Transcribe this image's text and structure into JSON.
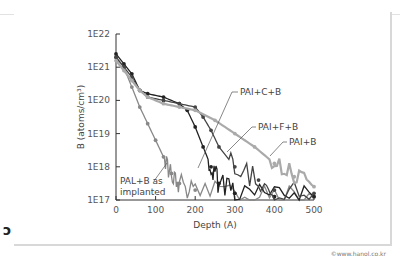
{
  "chart_data": {
    "type": "line",
    "title": "",
    "xlabel": "Depth (A)",
    "ylabel": "B (atoms/cm³)",
    "xlim": [
      0,
      500
    ],
    "ylim_log": [
      "1E17",
      "1E22"
    ],
    "x_ticks": [
      "0",
      "100",
      "200",
      "300",
      "400",
      "500"
    ],
    "y_ticks": [
      "1E17",
      "1E18",
      "1E19",
      "1E20",
      "1E21",
      "1E22"
    ],
    "grid": false,
    "series": [
      {
        "name": "PAI+B as implanted",
        "color": "#888888",
        "x": [
          0,
          20,
          40,
          60,
          80,
          100,
          120,
          140,
          160,
          200,
          300,
          400,
          500
        ],
        "log10_y": [
          21.3,
          21.0,
          20.4,
          19.8,
          19.3,
          18.8,
          18.3,
          17.8,
          17.5,
          17.3,
          17.2,
          17.1,
          17.1
        ]
      },
      {
        "name": "PAI+C+B",
        "color": "#222222",
        "x": [
          0,
          20,
          40,
          60,
          80,
          120,
          160,
          180,
          200,
          220,
          240,
          260,
          300,
          400,
          500
        ],
        "log10_y": [
          21.4,
          21.1,
          20.8,
          20.3,
          20.2,
          20.1,
          19.9,
          19.7,
          19.2,
          18.6,
          18.0,
          17.5,
          17.2,
          17.1,
          17.1
        ]
      },
      {
        "name": "PAI+F+B",
        "color": "#444444",
        "x": [
          0,
          20,
          40,
          60,
          80,
          120,
          160,
          200,
          220,
          240,
          260,
          300,
          360,
          400,
          500
        ],
        "log10_y": [
          21.3,
          21.0,
          20.7,
          20.3,
          20.1,
          20.0,
          19.9,
          19.8,
          19.5,
          19.1,
          18.6,
          18.0,
          17.6,
          17.3,
          17.2
        ]
      },
      {
        "name": "PAI+B",
        "color": "#aaaaaa",
        "x": [
          0,
          20,
          40,
          60,
          80,
          120,
          160,
          200,
          250,
          300,
          350,
          400,
          450,
          500
        ],
        "log10_y": [
          21.2,
          20.9,
          20.6,
          20.3,
          20.1,
          19.9,
          19.8,
          19.7,
          19.4,
          19.0,
          18.6,
          18.1,
          17.7,
          17.4
        ]
      }
    ],
    "annotations": [
      "PAI+C+B",
      "PAI+F+B",
      "PAI+B",
      "PAL+B as implanted"
    ]
  },
  "labels": {
    "xlabel": "Depth (A)",
    "ylabel": "B (atoms/cm³)",
    "ann_c": "PAI+C+B",
    "ann_f": "PAI+F+B",
    "ann_b": "PAI+B",
    "ann_imp1": "PAL+B as",
    "ann_imp2": "implanted"
  },
  "credit": "©www.hanol.co.kr"
}
